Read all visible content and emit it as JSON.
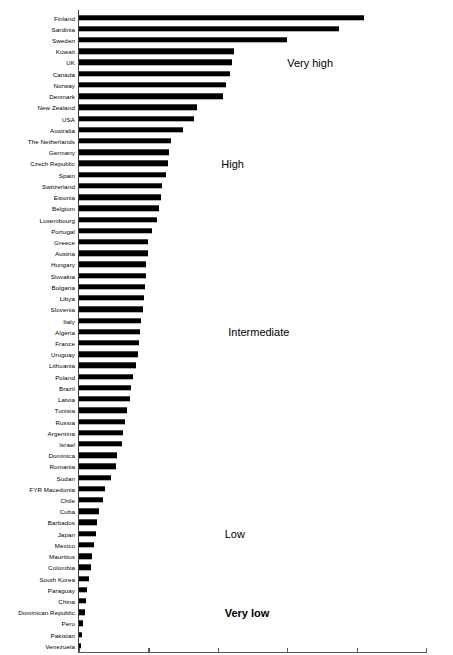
{
  "chart_data": {
    "type": "bar",
    "orientation": "horizontal",
    "title": "",
    "xlabel": "Incidence (per 100 000/year)",
    "ylabel": "",
    "xlim": [
      0,
      50
    ],
    "xticks": [
      0,
      10,
      20,
      30,
      40,
      50
    ],
    "grid": false,
    "legend": null,
    "categories": [
      "Finland",
      "Sardinia",
      "Sweden",
      "Kuwait",
      "UK",
      "Canada",
      "Norway",
      "Denmark",
      "New Zealand",
      "USA",
      "Australia",
      "The Netherlands",
      "Germany",
      "Czech Republic",
      "Spain",
      "Switzerland",
      "Estonia",
      "Belgium",
      "Luxembourg",
      "Portugal",
      "Greece",
      "Austria",
      "Hungary",
      "Slovakia",
      "Bulgaria",
      "Libya",
      "Slovenia",
      "Italy",
      "Algeria",
      "France",
      "Uruguay",
      "Lithuania",
      "Poland",
      "Brazil",
      "Latvia",
      "Tunisia",
      "Russia",
      "Argentina",
      "Israel",
      "Dominica",
      "Romania",
      "Sudan",
      "FYR Macedonia",
      "Chile",
      "Cuba",
      "Barbados",
      "Japan",
      "Mexico",
      "Mauritius",
      "Colombia",
      "South Korea",
      "Paraguay",
      "China",
      "Dominican Republic",
      "Peru",
      "Pakistan",
      "Venezuela"
    ],
    "values": [
      41.0,
      37.5,
      30.0,
      22.3,
      22.0,
      21.7,
      21.2,
      20.8,
      17.0,
      16.6,
      15.0,
      13.2,
      13.0,
      12.8,
      12.5,
      12.0,
      11.8,
      11.5,
      11.2,
      10.5,
      10.0,
      9.9,
      9.7,
      9.6,
      9.5,
      9.4,
      9.2,
      9.0,
      8.8,
      8.7,
      8.5,
      8.2,
      7.8,
      7.5,
      7.3,
      6.9,
      6.6,
      6.4,
      6.2,
      5.5,
      5.3,
      4.6,
      3.7,
      3.5,
      2.9,
      2.6,
      2.4,
      2.2,
      1.9,
      1.7,
      1.4,
      1.2,
      1.0,
      0.8,
      0.6,
      0.5,
      0.3
    ],
    "annotations": [
      {
        "text": "Very high",
        "x": 30.0,
        "category_index": 4,
        "bold": false
      },
      {
        "text": "High",
        "x": 20.5,
        "category_index": 13,
        "bold": false
      },
      {
        "text": "Intermediate",
        "x": 21.5,
        "category_index": 28,
        "bold": false
      },
      {
        "text": "Low",
        "x": 21.0,
        "category_index": 46,
        "bold": false
      },
      {
        "text": "Very low",
        "x": 21.0,
        "category_index": 53,
        "bold": true
      }
    ],
    "bar_color": "#000000",
    "axis_color": "#5a5a5a",
    "background_color": "#ffffff"
  }
}
